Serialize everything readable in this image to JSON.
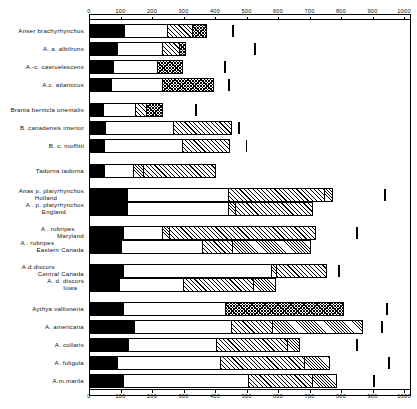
{
  "chart_data": {
    "type": "bar",
    "title": "",
    "xlabel": "",
    "ylabel": "",
    "orientation": "horizontal",
    "stacked": true,
    "grid": false,
    "legend": "none",
    "xlim": [
      0,
      1000
    ],
    "xticks": [
      0,
      100,
      200,
      300,
      400,
      500,
      600,
      700,
      800,
      900,
      1000
    ],
    "xtick_labels": [
      "0",
      "100",
      "200",
      "300",
      "400",
      "500",
      "600",
      "700",
      "800",
      "900",
      "1000"
    ],
    "axis_top": true,
    "axis_bottom": true,
    "segment_fills": [
      "black",
      "white",
      "diag",
      "diag2",
      "cross"
    ],
    "categories": [
      {
        "label_line1": "Anser  brachyrhynchus",
        "label_line2": "",
        "segments": [
          {
            "fill": "black",
            "end": 110
          },
          {
            "fill": "white",
            "end": 250
          },
          {
            "fill": "diag",
            "end": 330
          },
          {
            "fill": "cross",
            "end": 375
          }
        ],
        "marker": 454
      },
      {
        "label_line1": "A. a. albifrons",
        "label_line2": "",
        "segments": [
          {
            "fill": "black",
            "end": 86
          },
          {
            "fill": "white",
            "end": 235
          },
          {
            "fill": "diag",
            "end": 290
          },
          {
            "fill": "cross",
            "end": 308
          }
        ],
        "marker": 524
      },
      {
        "label_line1": "A.-c. caeruelescens",
        "label_line2": "",
        "segments": [
          {
            "fill": "black",
            "end": 76
          },
          {
            "fill": "white",
            "end": 216
          },
          {
            "fill": "cross",
            "end": 299
          }
        ],
        "marker": 429
      },
      {
        "label_line1": "A.c. atlanticus",
        "label_line2": "",
        "segments": [
          {
            "fill": "black",
            "end": 67
          },
          {
            "fill": "white",
            "end": 232
          },
          {
            "fill": "cross",
            "end": 397
          }
        ],
        "marker": 441
      },
      {
        "label_line1": "Branta bernicla orientalis",
        "label_line2": "",
        "segments": [
          {
            "fill": "black",
            "end": 44
          },
          {
            "fill": "white",
            "end": 146
          },
          {
            "fill": "diag",
            "end": 184
          },
          {
            "fill": "cross",
            "end": 235
          }
        ],
        "marker": 337
      },
      {
        "label_line1": "B. canadensis  interior",
        "label_line2": "",
        "segments": [
          {
            "fill": "black",
            "end": 48
          },
          {
            "fill": "white",
            "end": 267
          },
          {
            "fill": "diag",
            "end": 454
          }
        ],
        "marker": 473
      },
      {
        "label_line1": "B. c. moffitti",
        "label_line2": "",
        "segments": [
          {
            "fill": "black",
            "end": 44
          },
          {
            "fill": "white",
            "end": 295
          },
          {
            "fill": "diag",
            "end": 448
          }
        ],
        "marker": 498
      },
      {
        "label_line1": "Tadorna  tadorna",
        "label_line2": "",
        "segments": [
          {
            "fill": "black",
            "end": 44
          },
          {
            "fill": "white",
            "end": 140
          },
          {
            "fill": "diag2",
            "end": 171
          },
          {
            "fill": "diag",
            "end": 403
          }
        ],
        "marker": null
      },
      {
        "label_line1": "Anas p. platyrhynchos",
        "label_line2": "Holland",
        "segments": [
          {
            "fill": "black",
            "end": 117
          },
          {
            "fill": "white",
            "end": 441
          },
          {
            "fill": "diag",
            "end": 749
          },
          {
            "fill": "diag2",
            "end": 775
          }
        ],
        "marker": 937
      },
      {
        "label_line1": "A . p. platyrhynchos",
        "label_line2": "England",
        "segments": [
          {
            "fill": "black",
            "end": 117
          },
          {
            "fill": "white",
            "end": 441
          },
          {
            "fill": "diag2",
            "end": 463
          },
          {
            "fill": "diag",
            "end": 711
          }
        ],
        "marker": null
      },
      {
        "label_line1": "A . rubripes",
        "label_line2": "Maryland",
        "segments": [
          {
            "fill": "black",
            "end": 105
          },
          {
            "fill": "white",
            "end": 232
          },
          {
            "fill": "diag2",
            "end": 254
          },
          {
            "fill": "diag",
            "end": 721
          }
        ],
        "marker": 848
      },
      {
        "label_line1": "A . rubripes",
        "label_line2": "Eastern  Canada",
        "segments": [
          {
            "fill": "black",
            "end": 98
          },
          {
            "fill": "white",
            "end": 359
          },
          {
            "fill": "diag",
            "end": 454
          },
          {
            "fill": "diag2",
            "end": 705
          }
        ],
        "marker": null
      },
      {
        "label_line1": "A.d.discors",
        "label_line2": "Central  Canada",
        "segments": [
          {
            "fill": "black",
            "end": 105
          },
          {
            "fill": "white",
            "end": 581
          },
          {
            "fill": "diag2",
            "end": 597
          },
          {
            "fill": "diag",
            "end": 756
          }
        ],
        "marker": 791
      },
      {
        "label_line1": "A. d. discors",
        "label_line2": "Iowa",
        "segments": [
          {
            "fill": "black",
            "end": 92
          },
          {
            "fill": "white",
            "end": 299
          },
          {
            "fill": "diag",
            "end": 524
          },
          {
            "fill": "diag2",
            "end": 594
          }
        ],
        "marker": null
      },
      {
        "label_line1": "Aythya vallisneria",
        "label_line2": "",
        "segments": [
          {
            "fill": "black",
            "end": 105
          },
          {
            "fill": "white",
            "end": 432
          },
          {
            "fill": "cross",
            "end": 810
          }
        ],
        "marker": 943
      },
      {
        "label_line1": "A. americana",
        "label_line2": "",
        "segments": [
          {
            "fill": "black",
            "end": 140
          },
          {
            "fill": "white",
            "end": 451
          },
          {
            "fill": "diag",
            "end": 581
          },
          {
            "fill": "diag2",
            "end": 870
          }
        ],
        "marker": 927
      },
      {
        "label_line1": "A. collaris",
        "label_line2": "",
        "segments": [
          {
            "fill": "black",
            "end": 121
          },
          {
            "fill": "white",
            "end": 403
          },
          {
            "fill": "diag",
            "end": 632
          },
          {
            "fill": "diag2",
            "end": 670
          }
        ],
        "marker": 848
      },
      {
        "label_line1": "A. fuligula",
        "label_line2": "",
        "segments": [
          {
            "fill": "black",
            "end": 86
          },
          {
            "fill": "white",
            "end": 416
          },
          {
            "fill": "diag",
            "end": 686
          },
          {
            "fill": "diag2",
            "end": 765
          }
        ],
        "marker": 949
      },
      {
        "label_line1": "A.m.marila",
        "label_line2": "",
        "segments": [
          {
            "fill": "black",
            "end": 105
          },
          {
            "fill": "white",
            "end": 505
          },
          {
            "fill": "diag",
            "end": 711
          },
          {
            "fill": "diag2",
            "end": 787
          }
        ],
        "marker": 902
      }
    ]
  }
}
